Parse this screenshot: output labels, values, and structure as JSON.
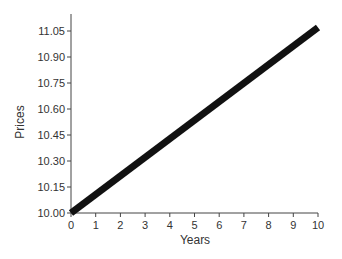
{
  "chart_data": {
    "type": "line",
    "title": "",
    "xlabel": "Years",
    "ylabel": "Prices",
    "x_ticks": [
      "0",
      "1",
      "2",
      "3",
      "4",
      "5",
      "6",
      "7",
      "8",
      "9",
      "10"
    ],
    "y_ticks": [
      "10.00",
      "10.15",
      "10.30",
      "10.45",
      "10.60",
      "10.75",
      "10.90",
      "11.05"
    ],
    "xlim": [
      0,
      10
    ],
    "ylim": [
      10.0,
      11.1
    ],
    "grid": false,
    "legend": null,
    "series": [
      {
        "name": "Price",
        "x": [
          0,
          10
        ],
        "y": [
          10.0,
          11.07
        ],
        "color": "#111111",
        "line_width": "thick"
      }
    ]
  }
}
